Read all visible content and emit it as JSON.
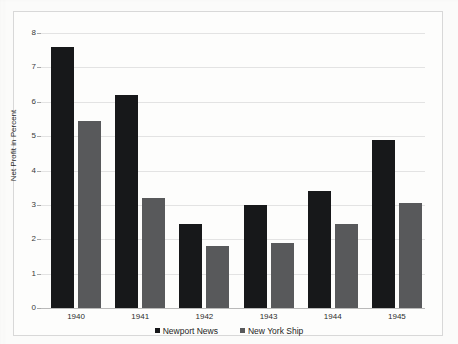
{
  "chart_data": {
    "type": "bar",
    "title": "",
    "subtitle": "",
    "xlabel": "",
    "ylabel": "Net Profit in Percent",
    "categories": [
      "1940",
      "1941",
      "1942",
      "1943",
      "1944",
      "1945"
    ],
    "series": [
      {
        "name": "Newport News",
        "color": "#17181a",
        "values": [
          7.6,
          6.2,
          2.45,
          3.0,
          3.4,
          4.9
        ]
      },
      {
        "name": "New York Ship",
        "color": "#58595b",
        "values": [
          5.45,
          3.2,
          1.8,
          1.9,
          2.45,
          3.05
        ]
      }
    ],
    "ylim": [
      0,
      8
    ],
    "ytick_values": [
      "0",
      "1",
      "2",
      "3",
      "4",
      "5",
      "6",
      "7",
      "8"
    ],
    "grid": true,
    "legend_position": "bottom",
    "colors": {
      "background": "#fbfbfa",
      "plot_background": "#fdfdfc",
      "gridline": "#e3e3e3",
      "axis": "#b9b9b9",
      "frame": "#d8d8d8",
      "text": "#2d2d2d"
    }
  },
  "legend": {
    "entries": [
      {
        "label": "Newport News"
      },
      {
        "label": "New York Ship"
      }
    ]
  }
}
